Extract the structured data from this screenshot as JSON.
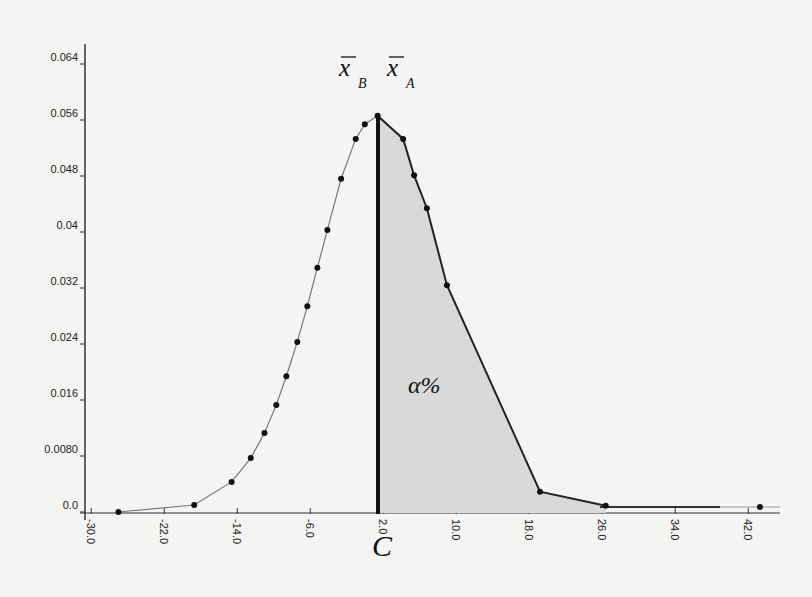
{
  "chart_data": {
    "type": "line",
    "title": "",
    "xlabel": "",
    "ylabel": "",
    "xlim": [
      -30.0,
      46.0
    ],
    "ylim": [
      0.0,
      0.068
    ],
    "grid": false,
    "x_ticks": [
      "-30.0",
      "-22.0",
      "-14.0",
      "-6.0",
      "2.0",
      "10.0",
      "18.0",
      "26.0",
      "34.0",
      "42.0"
    ],
    "y_ticks": [
      "0.0",
      "0.0080",
      "0.016",
      "0.024",
      "0.032",
      "0.04",
      "0.048",
      "0.056",
      "0.064"
    ],
    "series": [
      {
        "name": "distribution",
        "x": [
          -26.8,
          -18.5,
          -14.4,
          -12.3,
          -10.8,
          -9.5,
          -8.4,
          -7.2,
          -6.1,
          -5.0,
          -3.9,
          -2.4,
          -0.8,
          0.2,
          1.6,
          4.4,
          5.6,
          7.0,
          9.2,
          19.4,
          26.6,
          43.5
        ],
        "values": [
          0.0,
          0.001,
          0.0043,
          0.0077,
          0.0113,
          0.0153,
          0.0194,
          0.0243,
          0.0294,
          0.0349,
          0.0403,
          0.0476,
          0.0533,
          0.0554,
          0.0566,
          0.0533,
          0.0481,
          0.0434,
          0.0324,
          0.0029,
          0.0009,
          0.0007
        ]
      }
    ],
    "annotations": {
      "critical_value_label": "C",
      "critical_value_x": 1.6,
      "shaded_area_label": "α%",
      "mean_b_label": "x̄B",
      "mean_a_label": "x̄A"
    },
    "shaded_region": {
      "from_x": 1.6,
      "to_x": 26.6,
      "color": "#d9d9d9"
    }
  }
}
